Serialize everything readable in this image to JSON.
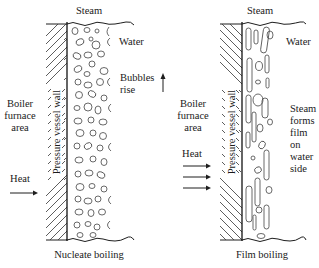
{
  "figure": {
    "panels": [
      {
        "id": "nucleate",
        "steam_label": "Steam",
        "water_label": "Water",
        "wall_label": "Pressure vessel wall",
        "furnace_label": [
          "Boiler",
          "furnace",
          "area"
        ],
        "heat_label": "Heat",
        "heat_arrows": 1,
        "annotation": [
          "Bubbles",
          "rise"
        ],
        "annotation_arrow": "up-arrow",
        "caption": "Nucleate boiling",
        "hatch_direction": "forward-slash",
        "bubble_style": "small round bubbles"
      },
      {
        "id": "film",
        "steam_label": "Steam",
        "water_label": "Water",
        "wall_label": "Pressure vessel wall",
        "furnace_label": [
          "Boiler",
          "furnace",
          "area"
        ],
        "heat_label": "Heat",
        "heat_arrows": 3,
        "annotation": [
          "Steam",
          "forms",
          "film",
          "on",
          "water",
          "side"
        ],
        "caption": "Film boiling",
        "hatch_direction": "back-slash",
        "bubble_style": "elongated vapor columns"
      }
    ],
    "colors": {
      "background": "#ffffff",
      "ink": "#1e1e1e"
    }
  }
}
